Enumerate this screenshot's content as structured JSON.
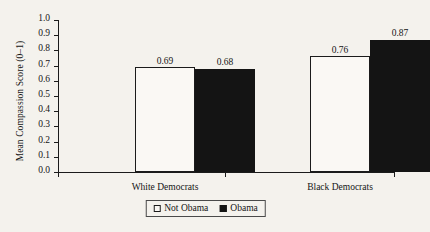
{
  "chart_data": {
    "type": "bar",
    "title": "",
    "xlabel": "",
    "ylabel": "Mean Compassion Score (0–1)",
    "ylim": [
      0.0,
      1.0
    ],
    "ytick_labels": [
      "0.0",
      "0.1",
      "0.2",
      "0.3",
      "0.4",
      "0.5",
      "0.6",
      "0.7",
      "0.8",
      "0.9",
      "1.0"
    ],
    "ytick_values": [
      0.0,
      0.1,
      0.2,
      0.3,
      0.4,
      0.5,
      0.6,
      0.7,
      0.8,
      0.9,
      1.0
    ],
    "grid": false,
    "legend_position": "bottom-center",
    "categories": [
      "White Democrats",
      "Black Democrats"
    ],
    "series": [
      {
        "name": "Not Obama",
        "style": "hollow",
        "color": "#ffffff",
        "edge_color": "#1b1b1b",
        "values": [
          0.69,
          0.76
        ],
        "labels": [
          "0.69",
          "0.76"
        ]
      },
      {
        "name": "Obama",
        "style": "solid",
        "color": "#141414",
        "edge_color": "#141414",
        "values": [
          0.68,
          0.87
        ],
        "labels": [
          "0.68",
          "0.87"
        ]
      }
    ]
  },
  "legend": {
    "entries": [
      {
        "label": "Not Obama",
        "swatch": "hollow-square-icon"
      },
      {
        "label": "Obama",
        "swatch": "filled-square-icon"
      }
    ]
  }
}
